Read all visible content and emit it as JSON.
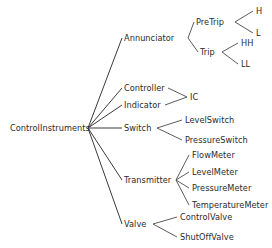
{
  "diagram": {
    "type": "tree-taxonomy",
    "orientation": "left-to-right",
    "line_color": "#4a4a4a",
    "text_color": "#2b2b2b",
    "background_color": "#ffffff",
    "root": {
      "id": "root",
      "label": "ControlInstruments",
      "x": 10,
      "y": 128,
      "anchor_x": 88,
      "anchor_y": 128
    },
    "nodes": [
      {
        "id": "annunciator",
        "label": "Annunciator",
        "level": 1,
        "x": 124,
        "y": 38,
        "anchor_left": 122,
        "anchor_right": 188,
        "parent": "root"
      },
      {
        "id": "pretrip",
        "label": "PreTrip",
        "level": 2,
        "x": 196,
        "y": 22,
        "anchor_left": 194,
        "anchor_right": 231,
        "parent": "annunciator"
      },
      {
        "id": "h",
        "label": "H",
        "level": 3,
        "x": 256,
        "y": 11,
        "anchor_left": 254,
        "anchor_right": 262,
        "parent": "pretrip"
      },
      {
        "id": "l",
        "label": "L",
        "level": 3,
        "x": 256,
        "y": 33,
        "anchor_left": 254,
        "anchor_right": 261,
        "parent": "pretrip"
      },
      {
        "id": "trip",
        "label": "Trip",
        "level": 2,
        "x": 200,
        "y": 52,
        "anchor_left": 198,
        "anchor_right": 219,
        "parent": "annunciator"
      },
      {
        "id": "hh",
        "label": "HH",
        "level": 3,
        "x": 241,
        "y": 43,
        "anchor_left": 239,
        "anchor_right": 254,
        "parent": "trip"
      },
      {
        "id": "ll",
        "label": "LL",
        "level": 3,
        "x": 241,
        "y": 64,
        "anchor_left": 239,
        "anchor_right": 251,
        "parent": "trip"
      },
      {
        "id": "controller",
        "label": "Controller",
        "level": 1,
        "x": 124,
        "y": 88,
        "anchor_left": 122,
        "anchor_right": 166,
        "parent": "root"
      },
      {
        "id": "indicator",
        "label": "Indicator",
        "level": 1,
        "x": 124,
        "y": 105,
        "anchor_left": 122,
        "anchor_right": 162,
        "parent": "root"
      },
      {
        "id": "ic",
        "label": "IC",
        "level": 2,
        "x": 190,
        "y": 97,
        "anchor_left": 188,
        "anchor_right": 198,
        "parent": "controller-indicator"
      },
      {
        "id": "switch",
        "label": "Switch",
        "level": 1,
        "x": 124,
        "y": 128,
        "anchor_left": 122,
        "anchor_right": 154,
        "parent": "root"
      },
      {
        "id": "levelswitch",
        "label": "LevelSwitch",
        "level": 2,
        "x": 185,
        "y": 120,
        "anchor_left": 183,
        "anchor_right": 233,
        "parent": "switch"
      },
      {
        "id": "pressureswitch",
        "label": "PressureSwitch",
        "level": 2,
        "x": 185,
        "y": 140,
        "anchor_left": 183,
        "anchor_right": 247,
        "parent": "switch"
      },
      {
        "id": "transmitter",
        "label": "Transmitter",
        "level": 1,
        "x": 124,
        "y": 180,
        "anchor_left": 122,
        "anchor_right": 172,
        "parent": "root"
      },
      {
        "id": "flowmeter",
        "label": "FlowMeter",
        "level": 2,
        "x": 192,
        "y": 155,
        "anchor_left": 190,
        "anchor_right": 235,
        "parent": "transmitter"
      },
      {
        "id": "levelmeter",
        "label": "LevelMeter",
        "level": 2,
        "x": 192,
        "y": 172,
        "anchor_left": 190,
        "anchor_right": 237,
        "parent": "transmitter"
      },
      {
        "id": "pressuremeter",
        "label": "PressureMeter",
        "level": 2,
        "x": 192,
        "y": 188,
        "anchor_left": 190,
        "anchor_right": 250,
        "parent": "transmitter"
      },
      {
        "id": "temperaturemeter",
        "label": "TemperatureMeter",
        "level": 2,
        "x": 192,
        "y": 205,
        "anchor_left": 190,
        "anchor_right": 271,
        "parent": "transmitter"
      },
      {
        "id": "valve",
        "label": "Valve",
        "level": 1,
        "x": 124,
        "y": 224,
        "anchor_left": 122,
        "anchor_right": 150,
        "parent": "root"
      },
      {
        "id": "controlvalve",
        "label": "ControlValve",
        "level": 2,
        "x": 180,
        "y": 217,
        "anchor_left": 178,
        "anchor_right": 232,
        "parent": "valve"
      },
      {
        "id": "shutoffvalve",
        "label": "ShutOffValve",
        "level": 2,
        "x": 180,
        "y": 237,
        "anchor_left": 178,
        "anchor_right": 235,
        "parent": "valve"
      }
    ],
    "edges": [
      {
        "id": "edge-root-annunciator",
        "from": "root",
        "to": "annunciator",
        "x1": 88,
        "y1": 128,
        "x2": 122,
        "y2": 38
      },
      {
        "id": "edge-root-controller",
        "from": "root",
        "to": "controller",
        "x1": 88,
        "y1": 128,
        "x2": 122,
        "y2": 88
      },
      {
        "id": "edge-root-indicator",
        "from": "root",
        "to": "indicator",
        "x1": 88,
        "y1": 128,
        "x2": 122,
        "y2": 105
      },
      {
        "id": "edge-root-switch",
        "from": "root",
        "to": "switch",
        "x1": 88,
        "y1": 128,
        "x2": 122,
        "y2": 128
      },
      {
        "id": "edge-root-transmitter",
        "from": "root",
        "to": "transmitter",
        "x1": 88,
        "y1": 128,
        "x2": 122,
        "y2": 180
      },
      {
        "id": "edge-root-valve",
        "from": "root",
        "to": "valve",
        "x1": 88,
        "y1": 128,
        "x2": 122,
        "y2": 224
      },
      {
        "id": "edge-annunciator-pretrip",
        "from": "annunciator",
        "to": "pretrip",
        "x1": 188,
        "y1": 38,
        "x2": 194,
        "y2": 22
      },
      {
        "id": "edge-annunciator-trip",
        "from": "annunciator",
        "to": "trip",
        "x1": 188,
        "y1": 38,
        "x2": 198,
        "y2": 52
      },
      {
        "id": "edge-pretrip-h",
        "from": "pretrip",
        "to": "h",
        "x1": 235,
        "y1": 22,
        "x2": 253,
        "y2": 11
      },
      {
        "id": "edge-pretrip-l",
        "from": "pretrip",
        "to": "l",
        "x1": 235,
        "y1": 22,
        "x2": 253,
        "y2": 33
      },
      {
        "id": "edge-trip-hh",
        "from": "trip",
        "to": "hh",
        "x1": 222,
        "y1": 52,
        "x2": 238,
        "y2": 43
      },
      {
        "id": "edge-trip-ll",
        "from": "trip",
        "to": "ll",
        "x1": 222,
        "y1": 52,
        "x2": 238,
        "y2": 64
      },
      {
        "id": "edge-controller-ic",
        "from": "controller",
        "to": "ic",
        "x1": 168,
        "y1": 88,
        "x2": 187,
        "y2": 97
      },
      {
        "id": "edge-indicator-ic",
        "from": "indicator",
        "to": "ic",
        "x1": 165,
        "y1": 105,
        "x2": 187,
        "y2": 97
      },
      {
        "id": "edge-switch-levelswitch",
        "from": "switch",
        "to": "levelswitch",
        "x1": 157,
        "y1": 128,
        "x2": 182,
        "y2": 120
      },
      {
        "id": "edge-switch-pressureswitch",
        "from": "switch",
        "to": "pressureswitch",
        "x1": 157,
        "y1": 128,
        "x2": 182,
        "y2": 140
      },
      {
        "id": "edge-transmitter-flow",
        "from": "transmitter",
        "to": "flowmeter",
        "x1": 176,
        "y1": 180,
        "x2": 189,
        "y2": 155
      },
      {
        "id": "edge-transmitter-level",
        "from": "transmitter",
        "to": "levelmeter",
        "x1": 176,
        "y1": 180,
        "x2": 189,
        "y2": 172
      },
      {
        "id": "edge-transmitter-pressure",
        "from": "transmitter",
        "to": "pressuremeter",
        "x1": 176,
        "y1": 180,
        "x2": 189,
        "y2": 188
      },
      {
        "id": "edge-transmitter-temp",
        "from": "transmitter",
        "to": "temperaturemeter",
        "x1": 176,
        "y1": 180,
        "x2": 189,
        "y2": 205
      },
      {
        "id": "edge-valve-controlvalve",
        "from": "valve",
        "to": "controlvalve",
        "x1": 153,
        "y1": 224,
        "x2": 177,
        "y2": 217
      },
      {
        "id": "edge-valve-shutoffvalve",
        "from": "valve",
        "to": "shutoffvalve",
        "x1": 153,
        "y1": 224,
        "x2": 177,
        "y2": 237
      }
    ]
  }
}
